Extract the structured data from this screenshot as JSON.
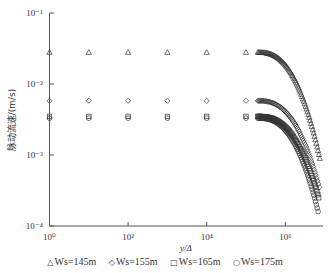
{
  "chart_data": {
    "type": "scatter",
    "title": "",
    "xlabel": "y/Δ",
    "ylabel": "脉动流速/(m/s)",
    "xscale": "log",
    "yscale": "log",
    "xlim": [
      1,
      8000000
    ],
    "ylim": [
      0.0001,
      0.1
    ],
    "xticks": [
      {
        "value": 1,
        "label": "10⁰"
      },
      {
        "value": 100,
        "label": "10²"
      },
      {
        "value": 10000,
        "label": "10⁴"
      },
      {
        "value": 1000000,
        "label": "10⁶"
      }
    ],
    "yticks": [
      {
        "value": 0.1,
        "label": "10⁻¹"
      },
      {
        "value": 0.01,
        "label": "10⁻²"
      },
      {
        "value": 0.001,
        "label": "10⁻³"
      },
      {
        "value": 0.0001,
        "label": "10⁻⁴"
      }
    ],
    "grid": false,
    "legend_position": "bottom",
    "series": [
      {
        "name": "Ws=145m",
        "marker": "triangle",
        "plateau": 0.028,
        "end": 0.0009
      },
      {
        "name": "Ws=155m",
        "marker": "diamond",
        "plateau": 0.0058,
        "end": 0.00035
      },
      {
        "name": "Ws=165m",
        "marker": "square",
        "plateau": 0.0035,
        "end": 0.00025
      },
      {
        "name": "Ws=175m",
        "marker": "circle",
        "plateau": 0.0033,
        "end": 0.00016
      }
    ]
  },
  "legend": {
    "items": [
      {
        "symbol": "△",
        "label": "Ws=145m"
      },
      {
        "symbol": "◇",
        "label": "Ws=155m"
      },
      {
        "symbol": "□",
        "label": "Ws=165m"
      },
      {
        "symbol": "○",
        "label": "Ws=175m"
      }
    ]
  }
}
